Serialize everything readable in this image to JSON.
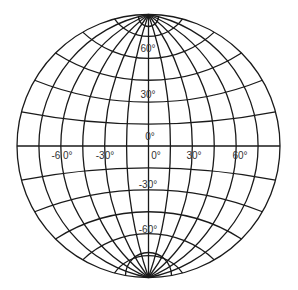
{
  "diagram": {
    "type": "globular-projection-graticule",
    "center": {
      "x": 148.5,
      "y": 146
    },
    "radius": 131.5,
    "meridian_step_deg": 15,
    "parallel_step_deg": 15,
    "colors": {
      "line": "#1a1a1a",
      "label": "#333333",
      "background": "#ffffff"
    },
    "latitude_labels": [
      {
        "text": "60°",
        "x": 148,
        "y": 52
      },
      {
        "text": "30°",
        "x": 148,
        "y": 98
      },
      {
        "text": "0°",
        "x": 150,
        "y": 140
      },
      {
        "text": "-30°",
        "x": 148,
        "y": 188
      },
      {
        "text": "-60°",
        "x": 148,
        "y": 233
      }
    ],
    "longitude_labels": [
      {
        "text": "-6 0°",
        "x": 62,
        "y": 159
      },
      {
        "text": "-30°",
        "x": 105,
        "y": 159
      },
      {
        "text": "0°",
        "x": 156,
        "y": 159
      },
      {
        "text": "30°",
        "x": 194,
        "y": 159
      },
      {
        "text": "60°",
        "x": 240,
        "y": 159
      }
    ]
  }
}
